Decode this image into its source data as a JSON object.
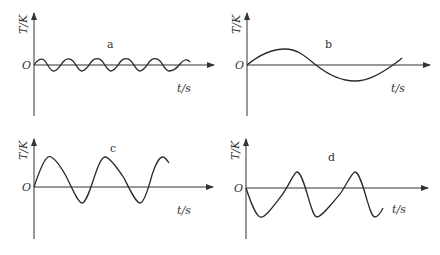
{
  "panels": [
    {
      "id": "a",
      "label": "a",
      "y_axis_label": "T/K",
      "x_axis_label": "t/s",
      "origin_label": "O",
      "description": "small-amplitude, high-frequency sinusoid (~5 cycles)"
    },
    {
      "id": "b",
      "label": "b",
      "y_axis_label": "T/K",
      "x_axis_label": "t/s",
      "origin_label": "O",
      "description": "large-period sinusoid, ~1 cycle, starting upward"
    },
    {
      "id": "c",
      "label": "c",
      "y_axis_label": "T/K",
      "x_axis_label": "t/s",
      "origin_label": "O",
      "description": "asymmetric sawtooth-like wave starting upward, slow fall and fast rise"
    },
    {
      "id": "d",
      "label": "d",
      "y_axis_label": "T/K",
      "x_axis_label": "t/s",
      "origin_label": "O",
      "description": "asymmetric wave starting downward, slow rise and fast fall"
    }
  ],
  "colors": {
    "line": "#2a2a2a",
    "axis": "#333333",
    "background": "#ffffff"
  }
}
